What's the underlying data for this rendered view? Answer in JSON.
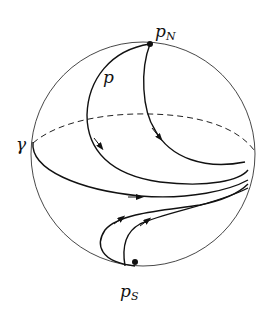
{
  "diagram": {
    "labels": {
      "north_pole": "p",
      "north_pole_sub": "N",
      "south_pole": "p",
      "south_pole_sub": "S",
      "point": "p",
      "curve": "γ"
    },
    "elements": [
      "sphere-outline",
      "dashed-equator-back",
      "north-pole-point",
      "south-pole-point",
      "trajectory-from-north-via-p",
      "trajectory-from-north-right",
      "trajectory-gamma",
      "trajectory-from-south-left",
      "trajectory-from-south-right"
    ],
    "colors": {
      "stroke": "#111111",
      "outline": "#333333",
      "background": "#ffffff"
    }
  }
}
